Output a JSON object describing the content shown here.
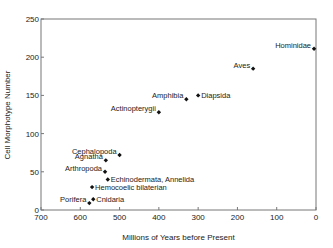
{
  "chart_data": {
    "type": "scatter",
    "title": "",
    "xlabel": "Millions of Years before Present",
    "ylabel": "Cell Morphotype Number",
    "xlim": [
      700,
      0
    ],
    "ylim": [
      0,
      250
    ],
    "x_reversed": true,
    "xticks": [
      700,
      600,
      500,
      400,
      300,
      200,
      100,
      0
    ],
    "yticks": [
      0,
      50,
      100,
      150,
      200,
      250
    ],
    "grid": false,
    "legend": null,
    "points": [
      {
        "label": "Hominidae",
        "x": 5,
        "y": 211,
        "label_pos": "left"
      },
      {
        "label": "Aves",
        "x": 160,
        "y": 185,
        "label_pos": "left"
      },
      {
        "label": "Diapsida",
        "x": 300,
        "y": 150,
        "label_pos": "right"
      },
      {
        "label": "Amphibia",
        "x": 330,
        "y": 145,
        "label_pos": "left"
      },
      {
        "label": "Actinopterygii",
        "x": 400,
        "y": 128,
        "label_pos": "left"
      },
      {
        "label": "Cephalopoda",
        "x": 500,
        "y": 72,
        "label_pos": "left"
      },
      {
        "label": "Agnatha",
        "x": 535,
        "y": 65,
        "label_pos": "left"
      },
      {
        "label": "Arthropoda",
        "x": 537,
        "y": 50,
        "label_pos": "left"
      },
      {
        "label": "Echinodermata, Annelida",
        "x": 530,
        "y": 40,
        "label_pos": "right"
      },
      {
        "label": "Hemocoelic bilaterian",
        "x": 570,
        "y": 30,
        "label_pos": "right"
      },
      {
        "label": "Cnidaria",
        "x": 567,
        "y": 14,
        "label_pos": "right"
      },
      {
        "label": "Porifera",
        "x": 577,
        "y": 9,
        "label_pos": "left"
      }
    ]
  },
  "axes": {
    "x_label": "Millions of Years before Present",
    "y_label": "Cell Morphotype Number"
  },
  "colors": {
    "axis": "#777777",
    "marker": "#111111",
    "text": "#222222"
  }
}
